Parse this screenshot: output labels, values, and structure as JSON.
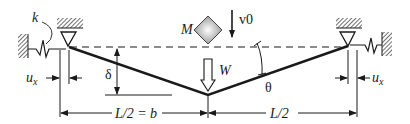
{
  "diagram": {
    "labels": {
      "spring": "k",
      "mass": "M",
      "velocity": "v0",
      "load": "W",
      "deflection": "δ",
      "angle": "θ",
      "left_disp": "u",
      "left_disp_sub": "x",
      "right_disp": "u",
      "right_disp_sub": "x",
      "left_span": "L/2 = b",
      "right_span": "L/2"
    },
    "colors": {
      "line": "#1a1a1a",
      "hatch": "#333333",
      "mass_fill": "#bdbdbd",
      "background": "#ffffff"
    }
  }
}
